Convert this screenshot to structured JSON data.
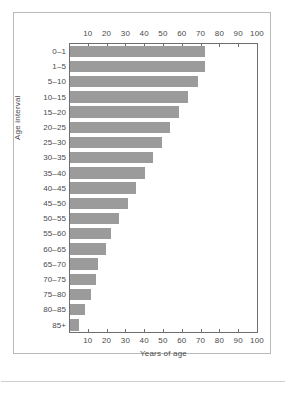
{
  "chart_data": {
    "type": "bar",
    "orientation": "horizontal",
    "title": "",
    "subtitle": "",
    "xlabel": "Years of age",
    "ylabel": "Age interval",
    "xlim": [
      0,
      100
    ],
    "xticks": [
      10,
      20,
      30,
      40,
      50,
      60,
      70,
      80,
      90,
      100
    ],
    "xtick_labels": [
      "10",
      "20",
      "30",
      "40",
      "50",
      "60",
      "70",
      "80",
      "90",
      "100"
    ],
    "top_axis": true,
    "bottom_axis": true,
    "grid": false,
    "legend": null,
    "legend_position": "none",
    "bar_color": "#9b9b9b",
    "axis_color": "#6e6e6e",
    "frame_color": "#b9b9b9",
    "categories": [
      "0–1",
      "1–5",
      "5–10",
      "10–15",
      "15–20",
      "20–25",
      "25–30",
      "30–35",
      "35–40",
      "40–45",
      "45–50",
      "50–55",
      "55–60",
      "60–65",
      "65–70",
      "70–75",
      "75–80",
      "80–85",
      "85+"
    ],
    "values": [
      72,
      72,
      68,
      63,
      58,
      53,
      49,
      44,
      40,
      35,
      31,
      26,
      22,
      19,
      15,
      14,
      11,
      8,
      5
    ],
    "annotations": []
  }
}
